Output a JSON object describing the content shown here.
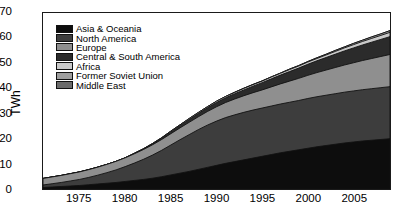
{
  "chart_data": {
    "type": "area",
    "stacked": true,
    "title": "",
    "xlabel": "",
    "ylabel": "TWh",
    "xlim": [
      1971,
      2009
    ],
    "ylim": [
      0,
      70
    ],
    "yticks": [
      0,
      10,
      20,
      30,
      40,
      50,
      60,
      70
    ],
    "xticks": [
      1975,
      1980,
      1985,
      1990,
      1995,
      2000,
      2005
    ],
    "grid": false,
    "legend_position": "upper left",
    "x": [
      1971,
      1972,
      1973,
      1974,
      1975,
      1976,
      1977,
      1978,
      1979,
      1980,
      1981,
      1982,
      1983,
      1984,
      1985,
      1986,
      1987,
      1988,
      1989,
      1990,
      1991,
      1992,
      1993,
      1994,
      1995,
      1996,
      1997,
      1998,
      1999,
      2000,
      2001,
      2002,
      2003,
      2004,
      2005,
      2006,
      2007,
      2008,
      2009
    ],
    "series": [
      {
        "name": "Asia & Oceania",
        "color": "#0d0d0d",
        "values": [
          0.6,
          0.8,
          1.0,
          1.2,
          1.4,
          1.7,
          2.0,
          2.3,
          2.6,
          3.0,
          3.4,
          3.8,
          4.3,
          4.9,
          5.6,
          6.3,
          7.0,
          7.8,
          8.6,
          9.4,
          10.2,
          10.9,
          11.6,
          12.3,
          13.0,
          13.7,
          14.4,
          15.0,
          15.6,
          16.2,
          16.8,
          17.3,
          17.8,
          18.3,
          18.7,
          19.1,
          19.4,
          19.7,
          20.0
        ]
      },
      {
        "name": "North America",
        "color": "#3d3d3d",
        "values": [
          1.0,
          1.3,
          1.6,
          2.0,
          2.4,
          2.9,
          3.5,
          4.2,
          5.0,
          5.9,
          6.9,
          8.0,
          9.2,
          10.5,
          11.9,
          13.3,
          14.6,
          15.8,
          16.8,
          17.6,
          18.2,
          18.6,
          18.9,
          19.1,
          19.2,
          19.3,
          19.4,
          19.5,
          19.6,
          19.8,
          19.9,
          20.0,
          20.1,
          20.2,
          20.3,
          20.4,
          20.5,
          20.6,
          20.7
        ]
      },
      {
        "name": "Europe",
        "color": "#8f8f8f",
        "values": [
          2.6,
          2.7,
          2.8,
          2.9,
          3.0,
          3.1,
          3.2,
          3.3,
          3.4,
          3.5,
          3.7,
          3.9,
          4.1,
          4.3,
          4.5,
          4.7,
          4.9,
          5.1,
          5.4,
          5.7,
          6.0,
          6.3,
          6.6,
          6.9,
          7.2,
          7.6,
          8.0,
          8.4,
          8.8,
          9.2,
          9.6,
          10.0,
          10.4,
          10.8,
          11.2,
          11.6,
          12.0,
          12.4,
          12.8
        ]
      },
      {
        "name": "Central & South America",
        "color": "#2b2b2b",
        "values": [
          0.0,
          0.0,
          0.0,
          0.0,
          0.0,
          0.0,
          0.0,
          0.0,
          0.0,
          0.0,
          0.1,
          0.2,
          0.3,
          0.5,
          0.7,
          0.9,
          1.1,
          1.3,
          1.5,
          1.7,
          1.9,
          2.1,
          2.3,
          2.6,
          2.9,
          3.2,
          3.5,
          3.8,
          4.1,
          4.4,
          4.7,
          5.0,
          5.3,
          5.6,
          5.9,
          6.2,
          6.5,
          6.8,
          7.1
        ]
      },
      {
        "name": "Africa",
        "color": "#c9c9c9",
        "values": [
          0.0,
          0.0,
          0.0,
          0.0,
          0.0,
          0.0,
          0.0,
          0.0,
          0.0,
          0.0,
          0.1,
          0.1,
          0.2,
          0.2,
          0.3,
          0.3,
          0.4,
          0.4,
          0.4,
          0.5,
          0.5,
          0.5,
          0.6,
          0.6,
          0.6,
          0.7,
          0.7,
          0.8,
          0.8,
          0.9,
          0.9,
          1.0,
          1.1,
          1.2,
          1.3,
          1.4,
          1.5,
          1.6,
          1.7
        ]
      },
      {
        "name": "Former Soviet Union",
        "color": "#9e9e9e",
        "values": [
          0.0,
          0.0,
          0.0,
          0.0,
          0.0,
          0.0,
          0.0,
          0.0,
          0.0,
          0.0,
          0.0,
          0.0,
          0.0,
          0.0,
          0.0,
          0.0,
          0.0,
          0.0,
          0.0,
          0.0,
          0.0,
          0.1,
          0.1,
          0.1,
          0.1,
          0.1,
          0.1,
          0.2,
          0.2,
          0.2,
          0.3,
          0.3,
          0.4,
          0.4,
          0.5,
          0.5,
          0.6,
          0.6,
          0.7
        ]
      },
      {
        "name": "Middle East",
        "color": "#6b6b6b",
        "values": [
          0.0,
          0.0,
          0.0,
          0.0,
          0.0,
          0.0,
          0.0,
          0.0,
          0.0,
          0.0,
          0.0,
          0.0,
          0.0,
          0.0,
          0.0,
          0.0,
          0.0,
          0.0,
          0.0,
          0.0,
          0.0,
          0.0,
          0.0,
          0.0,
          0.0,
          0.0,
          0.0,
          0.0,
          0.0,
          0.0,
          0.0,
          0.0,
          0.0,
          0.0,
          0.0,
          0.0,
          0.0,
          0.0,
          0.0
        ]
      }
    ]
  }
}
